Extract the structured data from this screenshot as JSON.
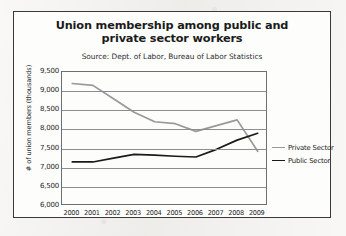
{
  "chart_data": {
    "type": "line",
    "title": "Union membership among public and private sector workers",
    "subtitle": "Source: Dept. of Labor, Bureau of Labor Statistics",
    "xlabel": "",
    "ylabel": "# of union members (thousands)",
    "categories": [
      "2000",
      "2001",
      "2002",
      "2003",
      "2004",
      "2005",
      "2006",
      "2007",
      "2008",
      "2009"
    ],
    "x": [
      2000,
      2001,
      2002,
      2003,
      2004,
      2005,
      2006,
      2007,
      2008,
      2009
    ],
    "ylim": [
      6000,
      9500
    ],
    "yticks": [
      "6,000",
      "6,500",
      "7,000",
      "7,500",
      "8,000",
      "8,500",
      "9,000",
      "9,500"
    ],
    "ytick_values": [
      6000,
      6500,
      7000,
      7500,
      8000,
      8500,
      9000,
      9500
    ],
    "grid": true,
    "legend_position": "right",
    "series": [
      {
        "name": "Private Sector",
        "color": "#999999",
        "values": [
          9200,
          9150,
          8800,
          8450,
          8200,
          8150,
          7950,
          8100,
          8250,
          7430
        ]
      },
      {
        "name": "Public Sector",
        "color": "#1a1a1a",
        "values": [
          7150,
          7150,
          7250,
          7350,
          7330,
          7300,
          7280,
          7480,
          7720,
          7900
        ]
      }
    ]
  },
  "legend": {
    "items": [
      {
        "label": "Private Sector"
      },
      {
        "label": "Public Sector"
      }
    ]
  },
  "colors": {
    "private_sector": "#999999",
    "public_sector": "#1a1a1a",
    "frame": "#3a3a3a",
    "gridline": "#8d8d8d",
    "page_background": "#f2f1ef",
    "figure_background": "#fdfdfc"
  }
}
